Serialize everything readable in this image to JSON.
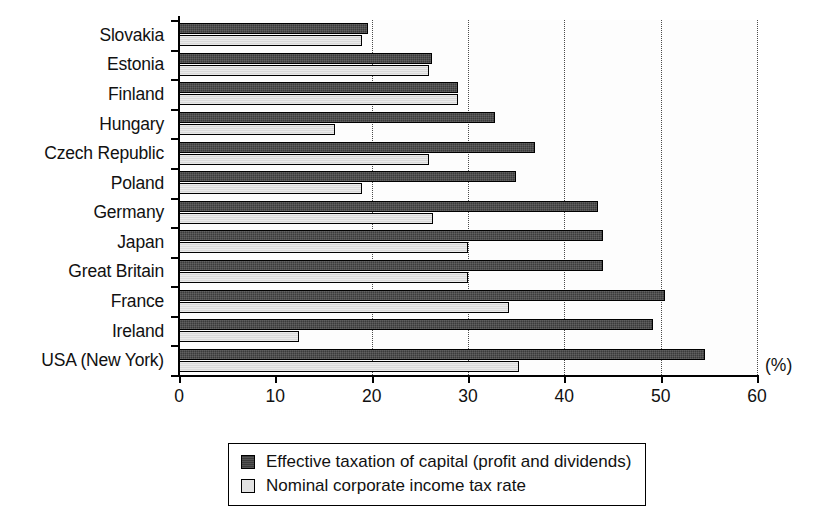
{
  "chart_data": {
    "type": "bar",
    "orientation": "horizontal",
    "title": "",
    "xlabel": "(%)",
    "ylabel": "",
    "xlim": [
      0,
      60
    ],
    "xticks": [
      0,
      10,
      20,
      30,
      40,
      50,
      60
    ],
    "xtick_labels": [
      "0",
      "10",
      "20",
      "30",
      "40",
      "50",
      "60"
    ],
    "grid": "vertical dotted gridlines at 20, 30, 40, 50, 60",
    "gridlines": [
      20,
      30,
      40,
      50,
      60
    ],
    "legend_position": "bottom-center",
    "categories": [
      "Slovakia",
      "Estonia",
      "Finland",
      "Hungary",
      "Czech Republic",
      "Poland",
      "Germany",
      "Japan",
      "Great Britain",
      "France",
      "Ireland",
      "USA (New York)"
    ],
    "series": [
      {
        "name": "Effective taxation of capital (profit and dividends)",
        "color": "#3b3b3b",
        "values": [
          19.6,
          26.3,
          29.0,
          32.8,
          37.0,
          35.0,
          43.5,
          44.0,
          44.0,
          50.5,
          49.2,
          54.6
        ]
      },
      {
        "name": "Nominal corporate income tax rate",
        "color": "#d9d9d9",
        "values": [
          19.0,
          26.0,
          29.0,
          16.2,
          26.0,
          19.0,
          26.4,
          30.0,
          30.0,
          34.3,
          12.5,
          35.3
        ]
      }
    ]
  },
  "axis": {
    "unit_label": "(%)"
  },
  "legend": {
    "entries": [
      {
        "label": "Effective taxation of capital (profit and dividends)",
        "swatch": "dark"
      },
      {
        "label": "Nominal corporate income tax rate",
        "swatch": "light"
      }
    ]
  }
}
